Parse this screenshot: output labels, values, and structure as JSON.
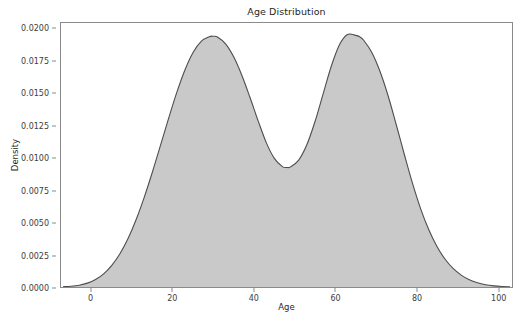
{
  "chart_data": {
    "type": "area",
    "title": "Age Distribution",
    "xlabel": "Age",
    "ylabel": "Density",
    "grid": false,
    "legend": null,
    "xlim": [
      -7.5,
      103.5
    ],
    "ylim": [
      0.0,
      0.0205
    ],
    "xticks": [
      0,
      20,
      40,
      60,
      80,
      100
    ],
    "xticklabels": [
      "0",
      "20",
      "40",
      "60",
      "80",
      "100"
    ],
    "yticks": [
      0.0,
      0.0025,
      0.005,
      0.0075,
      0.01,
      0.0125,
      0.015,
      0.0175,
      0.02
    ],
    "yticklabels": [
      "0.0000",
      "0.0025",
      "0.0050",
      "0.0075",
      "0.0100",
      "0.0125",
      "0.0150",
      "0.0175",
      "0.0200"
    ],
    "series": [
      {
        "name": "Age density",
        "fill_color": "#c9c9c9",
        "line_color": "#4d4d4d",
        "x": [
          -7,
          -5,
          -3,
          -1,
          1,
          3,
          5,
          7,
          9,
          11,
          13,
          15,
          17,
          19,
          21,
          23,
          25,
          27,
          29,
          30,
          31,
          33,
          35,
          37,
          39,
          41,
          43,
          45,
          47,
          48,
          49,
          51,
          53,
          55,
          57,
          59,
          61,
          63,
          65,
          66,
          67,
          69,
          71,
          73,
          75,
          77,
          79,
          81,
          83,
          85,
          87,
          89,
          91,
          93,
          95,
          97,
          99,
          101,
          103
        ],
        "y": [
          2e-05,
          6e-05,
          0.00014,
          0.0003,
          0.00058,
          0.00102,
          0.00168,
          0.00258,
          0.00376,
          0.00524,
          0.00698,
          0.00893,
          0.01101,
          0.01311,
          0.01511,
          0.01685,
          0.01821,
          0.01908,
          0.01944,
          0.01947,
          0.01941,
          0.01888,
          0.01787,
          0.01644,
          0.01473,
          0.01292,
          0.01123,
          0.00999,
          0.00935,
          0.00928,
          0.00933,
          0.00985,
          0.01104,
          0.01283,
          0.01498,
          0.01712,
          0.01879,
          0.01961,
          0.01954,
          0.01943,
          0.01916,
          0.01821,
          0.01675,
          0.01485,
          0.01262,
          0.01029,
          0.00806,
          0.00609,
          0.00446,
          0.00316,
          0.00217,
          0.00144,
          0.00092,
          0.00056,
          0.00033,
          0.00018,
          9e-05,
          4e-05,
          2e-05
        ]
      }
    ],
    "peaks": [
      {
        "x": 30,
        "y": 0.01947
      },
      {
        "x": 65,
        "y": 0.01961
      }
    ],
    "trough": {
      "x": 48,
      "y": 0.00928
    }
  },
  "figure": {
    "background_color": "#ffffff",
    "axes_edge_color": "#8a8a8a",
    "text_color": "#262626"
  }
}
